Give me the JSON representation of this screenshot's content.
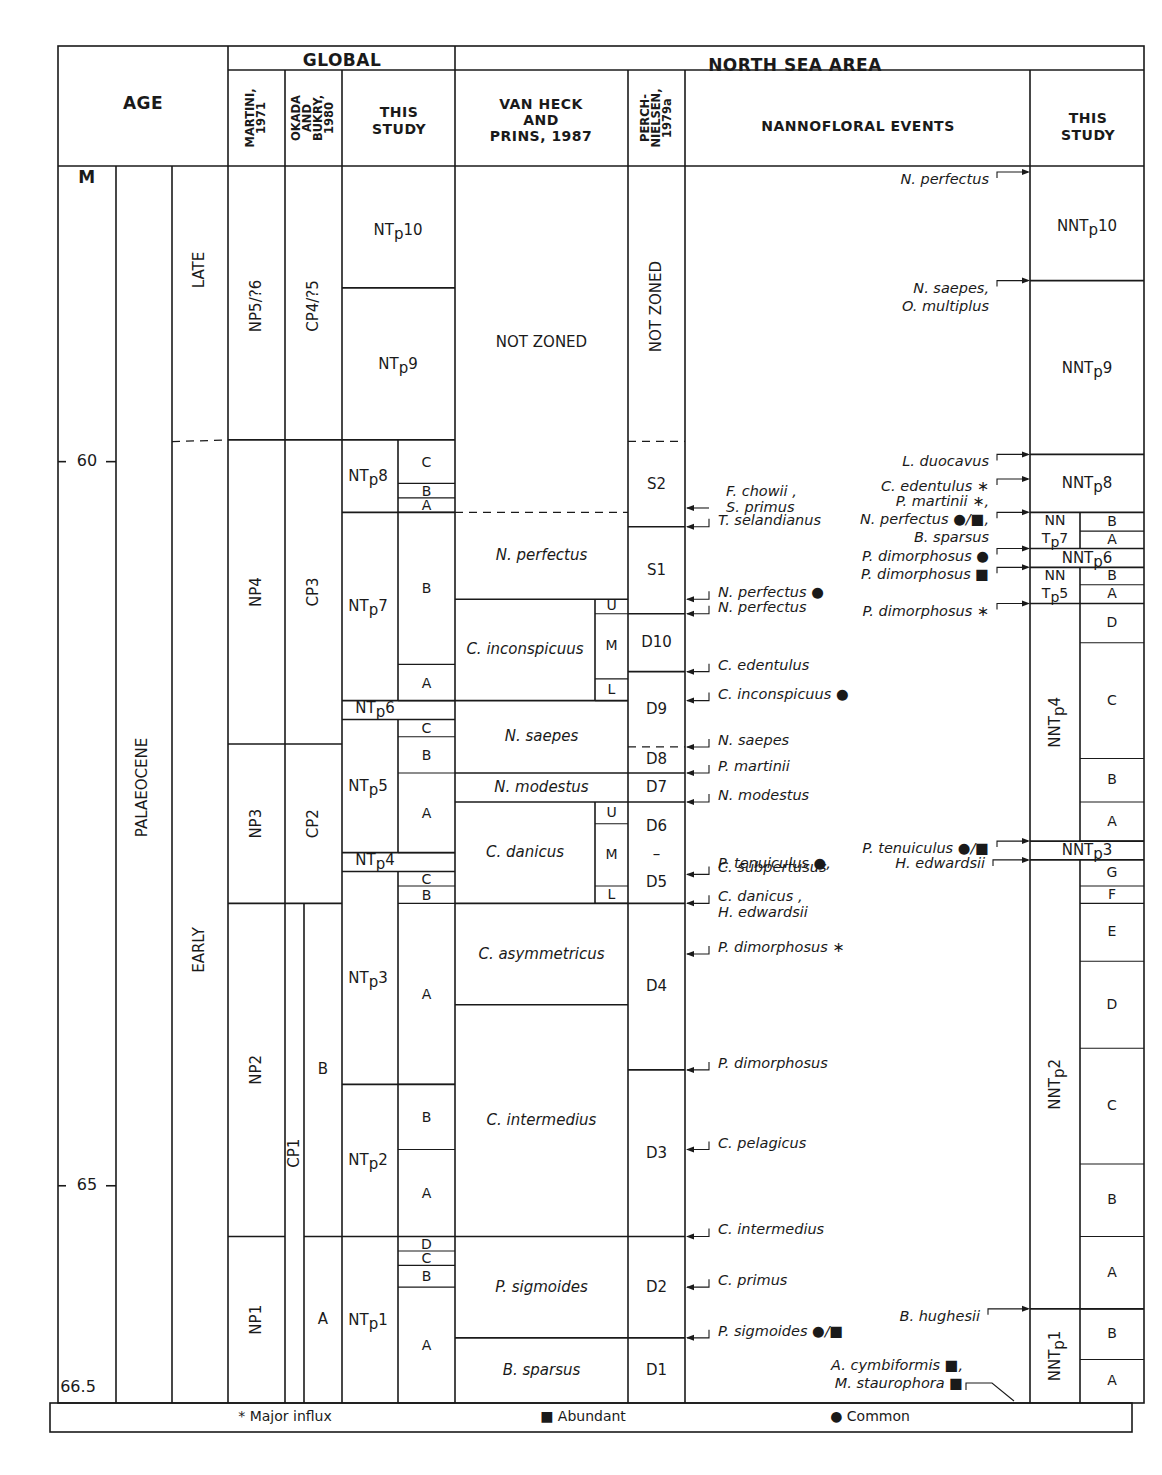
{
  "header": {
    "age": "AGE",
    "global": "GLOBAL",
    "north_sea": "NORTH SEA AREA",
    "martini": [
      "MARTINI,",
      "1971"
    ],
    "okada": [
      "OKADA",
      "AND",
      "BUKRY,",
      "1980"
    ],
    "this_study_global": [
      "THIS",
      "STUDY"
    ],
    "van_heck": [
      "VAN HECK",
      "AND",
      "PRINS, 1987"
    ],
    "perch": [
      "PERCH-",
      "NIELSEN,",
      "1979a"
    ],
    "events": "NANNOFLORAL EVENTS",
    "this_study_ns": [
      "THIS",
      "STUDY"
    ]
  },
  "age_axis": {
    "unit": "M",
    "range_ma": [
      58.0,
      66.5
    ],
    "ticks": [
      {
        "value": 60,
        "label": "60"
      },
      {
        "value": 65,
        "label": "65"
      }
    ],
    "bottom_label": "66.5",
    "epoch": "PALAEOCENE",
    "subepochs": [
      {
        "label": "LATE",
        "from": 58.0,
        "to": 60.0
      },
      {
        "label": "EARLY",
        "from": 60.0,
        "to": 66.5
      }
    ]
  },
  "columns": {
    "martini": [
      {
        "label": "NP5/?6",
        "from": 58.0,
        "to": 59.85
      },
      {
        "label": "NP4",
        "from": 59.85,
        "to": 61.95
      },
      {
        "label": "NP3",
        "from": 61.95,
        "to": 63.05
      },
      {
        "label": "NP2",
        "from": 63.05,
        "to": 65.35
      },
      {
        "label": "NP1",
        "from": 65.35,
        "to": 66.5
      }
    ],
    "okada": [
      {
        "label": "CP4/?5",
        "from": 58.0,
        "to": 59.85
      },
      {
        "label": "CP3",
        "from": 59.85,
        "to": 61.95
      },
      {
        "label": "CP2",
        "from": 61.95,
        "to": 63.05
      },
      {
        "label": "CP1",
        "from": 63.05,
        "to": 66.5
      }
    ],
    "okada_sub": [
      {
        "label": "B",
        "from": 63.05,
        "to": 65.35
      },
      {
        "label": "A",
        "from": 65.35,
        "to": 66.5
      }
    ],
    "global_this_study": [
      {
        "label": "NTp10",
        "from": 58.0,
        "to": 58.8
      },
      {
        "label": "NTp9",
        "from": 58.8,
        "to": 59.85
      },
      {
        "label": "NTp8",
        "from": 59.85,
        "to": 60.35
      },
      {
        "label": "NTp7",
        "from": 60.35,
        "to": 61.65
      },
      {
        "label": "NTp6",
        "from": 61.65,
        "to": 61.78
      },
      {
        "label": "NTp5",
        "from": 61.78,
        "to": 62.7
      },
      {
        "label": "NTp4",
        "from": 62.7,
        "to": 62.83
      },
      {
        "label": "NTp3",
        "from": 62.83,
        "to": 64.3
      },
      {
        "label": "NTp2",
        "from": 64.3,
        "to": 65.35
      },
      {
        "label": "NTp1",
        "from": 65.35,
        "to": 66.5
      }
    ],
    "global_this_study_sub": [
      {
        "label": "C",
        "from": 59.85,
        "to": 60.15
      },
      {
        "label": "B",
        "from": 60.15,
        "to": 60.25
      },
      {
        "label": "A",
        "from": 60.25,
        "to": 60.35
      },
      {
        "label": "B",
        "from": 60.35,
        "to": 61.4
      },
      {
        "label": "A",
        "from": 61.4,
        "to": 61.65
      },
      {
        "label": "C",
        "from": 61.78,
        "to": 61.9
      },
      {
        "label": "B",
        "from": 61.9,
        "to": 62.15
      },
      {
        "label": "A",
        "from": 62.15,
        "to": 62.7
      },
      {
        "label": "C",
        "from": 62.83,
        "to": 62.93
      },
      {
        "label": "B",
        "from": 62.93,
        "to": 63.05
      },
      {
        "label": "A",
        "from": 63.05,
        "to": 64.3
      },
      {
        "label": "B",
        "from": 64.3,
        "to": 64.75
      },
      {
        "label": "A",
        "from": 64.75,
        "to": 65.35
      },
      {
        "label": "D",
        "from": 65.35,
        "to": 65.45
      },
      {
        "label": "C",
        "from": 65.45,
        "to": 65.55
      },
      {
        "label": "B",
        "from": 65.55,
        "to": 65.7
      },
      {
        "label": "A",
        "from": 65.7,
        "to": 66.5
      }
    ],
    "van_heck": [
      {
        "label": "NOT ZONED",
        "from": 58.0,
        "to": 60.35,
        "italic": false,
        "lower_boundary": "dashed"
      },
      {
        "label": "N. perfectus",
        "from": 60.35,
        "to": 60.95,
        "italic": true
      },
      {
        "label": "C. inconspicuus",
        "from": 60.95,
        "to": 61.65,
        "italic": true
      },
      {
        "label": "N. saepes",
        "from": 61.65,
        "to": 62.15,
        "italic": true
      },
      {
        "label": "N. modestus",
        "from": 62.15,
        "to": 62.35,
        "italic": true
      },
      {
        "label": "C. danicus",
        "from": 62.35,
        "to": 63.05,
        "italic": true
      },
      {
        "label": "C. asymmetricus",
        "from": 63.05,
        "to": 63.75,
        "italic": true
      },
      {
        "label": "C. intermedius",
        "from": 63.75,
        "to": 65.35,
        "italic": true
      },
      {
        "label": "P. sigmoides",
        "from": 65.35,
        "to": 66.05,
        "italic": true
      },
      {
        "label": "B. sparsus",
        "from": 66.05,
        "to": 66.5,
        "italic": true
      }
    ],
    "van_heck_sub": [
      {
        "label": "U",
        "from": 60.95,
        "to": 61.05
      },
      {
        "label": "M",
        "from": 61.05,
        "to": 61.5
      },
      {
        "label": "L",
        "from": 61.5,
        "to": 61.65
      },
      {
        "label": "U",
        "from": 62.35,
        "to": 62.5
      },
      {
        "label": "M",
        "from": 62.5,
        "to": 62.93
      },
      {
        "label": "L",
        "from": 62.93,
        "to": 63.05
      }
    ],
    "perch": [
      {
        "label": "NOT ZONED",
        "from": 58.0,
        "to": 59.86,
        "vertical": true,
        "lower_boundary": "dashed"
      },
      {
        "label": "S2",
        "from": 59.86,
        "to": 60.45
      },
      {
        "label": "S1",
        "from": 60.45,
        "to": 61.05
      },
      {
        "label": "D10",
        "from": 61.05,
        "to": 61.45
      },
      {
        "label": "D9",
        "from": 61.45,
        "to": 61.97,
        "lower_boundary": "dashed"
      },
      {
        "label": "D8",
        "from": 61.97,
        "to": 62.15
      },
      {
        "label": "D7",
        "from": 62.15,
        "to": 62.35
      },
      {
        "label": "D6 – D5",
        "from": 62.35,
        "to": 63.05,
        "parts": [
          "D6",
          "–",
          "D5"
        ]
      },
      {
        "label": "D4",
        "from": 63.05,
        "to": 64.2
      },
      {
        "label": "D3",
        "from": 64.2,
        "to": 65.35
      },
      {
        "label": "D2",
        "from": 65.35,
        "to": 66.05
      },
      {
        "label": "D1",
        "from": 66.05,
        "to": 66.5
      }
    ],
    "ns_this_study": [
      {
        "label": "NNTp10",
        "from": 58.0,
        "to": 58.75
      },
      {
        "label": "NNTp9",
        "from": 58.75,
        "to": 59.95
      },
      {
        "label": "NNTp8",
        "from": 59.95,
        "to": 60.35
      },
      {
        "label": "NNTp7",
        "from": 60.35,
        "to": 60.6,
        "split": true
      },
      {
        "label": "NNTp6",
        "from": 60.6,
        "to": 60.73
      },
      {
        "label": "NNTp5",
        "from": 60.73,
        "to": 60.98,
        "split": true
      },
      {
        "label": "NNTp4",
        "from": 60.98,
        "to": 62.62,
        "vertical": true
      },
      {
        "label": "NNTp3",
        "from": 62.62,
        "to": 62.75
      },
      {
        "label": "NNTp2",
        "from": 62.75,
        "to": 65.85,
        "vertical": true
      },
      {
        "label": "NNTp1",
        "from": 65.85,
        "to": 66.5,
        "vertical": true
      }
    ],
    "ns_this_study_sub": [
      {
        "label": "B",
        "from": 60.35,
        "to": 60.48
      },
      {
        "label": "A",
        "from": 60.48,
        "to": 60.6
      },
      {
        "label": "B",
        "from": 60.73,
        "to": 60.85
      },
      {
        "label": "A",
        "from": 60.85,
        "to": 60.98
      },
      {
        "label": "D",
        "from": 60.98,
        "to": 61.25
      },
      {
        "label": "C",
        "from": 61.25,
        "to": 62.05
      },
      {
        "label": "B",
        "from": 62.05,
        "to": 62.35
      },
      {
        "label": "A",
        "from": 62.35,
        "to": 62.62
      },
      {
        "label": "G",
        "from": 62.75,
        "to": 62.93
      },
      {
        "label": "F",
        "from": 62.93,
        "to": 63.05
      },
      {
        "label": "E",
        "from": 63.05,
        "to": 63.45
      },
      {
        "label": "D",
        "from": 63.45,
        "to": 64.05
      },
      {
        "label": "C",
        "from": 64.05,
        "to": 64.85
      },
      {
        "label": "B",
        "from": 64.85,
        "to": 65.35
      },
      {
        "label": "A",
        "from": 65.35,
        "to": 65.85
      },
      {
        "label": "B",
        "from": 65.85,
        "to": 66.2
      },
      {
        "label": "A",
        "from": 66.2,
        "to": 66.5
      }
    ]
  },
  "events_left": [
    {
      "lines": [
        "F. chowii ,",
        "S. primus"
      ],
      "at": 60.32,
      "style": "plain-arrow"
    },
    {
      "lines": [
        "T. selandianus"
      ],
      "at": 60.45
    },
    {
      "lines": [
        "N. perfectus ●"
      ],
      "at": 60.95
    },
    {
      "lines": [
        "N. perfectus"
      ],
      "at": 61.05
    },
    {
      "lines": [
        "C. edentulus"
      ],
      "at": 61.45
    },
    {
      "lines": [
        "C. inconspicuus ●"
      ],
      "at": 61.65
    },
    {
      "lines": [
        "N. saepes"
      ],
      "at": 61.97
    },
    {
      "lines": [
        "P. martinii"
      ],
      "at": 62.15
    },
    {
      "lines": [
        "N. modestus"
      ],
      "at": 62.35
    },
    {
      "lines": [
        "P. tenuiculus  ●,"
      ],
      "at": null
    },
    {
      "lines": [
        "C. subpertusus"
      ],
      "at": 62.85
    },
    {
      "lines": [
        "C. danicus ,",
        "H. edwardsii"
      ],
      "at": 63.05
    },
    {
      "lines": [
        "P. dimorphosus ∗"
      ],
      "at": 63.4
    },
    {
      "lines": [
        "P. dimorphosus"
      ],
      "at": 64.2
    },
    {
      "lines": [
        "C. pelagicus"
      ],
      "at": 64.75
    },
    {
      "lines": [
        "C. intermedius"
      ],
      "at": 65.35
    },
    {
      "lines": [
        "C. primus"
      ],
      "at": 65.7
    },
    {
      "lines": [
        "P. sigmoides ●/■"
      ],
      "at": 66.05
    }
  ],
  "events_right": [
    {
      "lines": [
        "N. perfectus"
      ],
      "at": 58.0
    },
    {
      "lines": [
        "N. saepes,",
        "O. multiplus"
      ],
      "at": 58.75
    },
    {
      "lines": [
        "L. duocavus"
      ],
      "at": 59.95
    },
    {
      "lines": [
        "C. edentulus ∗"
      ],
      "at": 60.12
    },
    {
      "lines": [
        "P. martinii ∗,",
        "N. perfectus ●/■,",
        "B. sparsus"
      ],
      "at": 60.35
    },
    {
      "lines": [
        "P. dimorphosus ●"
      ],
      "at": 60.6
    },
    {
      "lines": [
        "P. dimorphosus ■"
      ],
      "at": 60.73
    },
    {
      "lines": [
        "P. dimorphosus ∗"
      ],
      "at": 60.98
    },
    {
      "lines": [
        "P. tenuiculus  ●/■"
      ],
      "at": 62.62
    },
    {
      "lines": [
        "H. edwardsii"
      ],
      "at": 62.75
    },
    {
      "lines": [
        "B. hughesii"
      ],
      "at": 65.85
    },
    {
      "lines": [
        "A. cymbiformis ■,",
        "M. staurophora ■"
      ],
      "at": 66.5,
      "style": "diagonal"
    }
  ],
  "legend": [
    {
      "symbol": "*",
      "label": "Major influx"
    },
    {
      "symbol": "■",
      "label": "Abundant"
    },
    {
      "symbol": "●",
      "label": "Common"
    }
  ]
}
